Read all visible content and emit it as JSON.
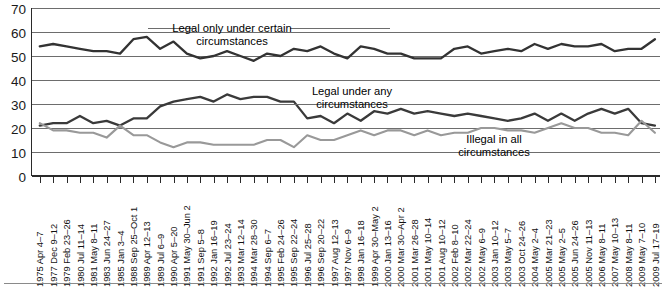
{
  "chart_data": {
    "type": "line",
    "title": "",
    "subtitle": "",
    "xlabel": "",
    "ylabel": "",
    "ylim": [
      0,
      70
    ],
    "yticks": [
      0,
      10,
      20,
      30,
      40,
      50,
      60,
      70
    ],
    "grid": true,
    "legend_position": "inline-annotations",
    "categories": [
      "1975 Apr 4–7",
      "1977 Dec 9–12",
      "1979 Feb 23–26",
      "1980 Jul 11–14",
      "1981 May 8–11",
      "1983 Jun 24–27",
      "1985 Jan 3–4",
      "1988 Sep 25–Oct 1",
      "1989 Apr 12–13",
      "1989 Jul 6–9",
      "1990 Apr 5–20",
      "1991 May 30–Jun 2",
      "1991 Sep 5–8",
      "1992 Jan 16–19",
      "1992 Jul 23–24",
      "1993 Mar 12–14",
      "1994 Mar 28–30",
      "1994 Sep 6–7",
      "1995 Feb 24–26",
      "1995 Sep 22–24",
      "1996 Jul 25–28",
      "1996 Sep 20–22",
      "1997 Aug 12–13",
      "1997 Nov 6–9",
      "1998 Jan 16–18",
      "1999 Apr 30–May 2",
      "2000 Jan 13–16",
      "2000 Mar 30–Apr 2",
      "2001 Mar 26–28",
      "2001 May 10–14",
      "2001 Aug 10–12",
      "2002 Feb 8–10",
      "2002 Mar 22–24",
      "2002 May 6–9",
      "2003 Jan 10–12",
      "2003 May 5–7",
      "2003 Oct 24–26",
      "2004 May 2–4",
      "2005 Mar 21–23",
      "2005 May 2–5",
      "2005 Jun 24–26",
      "2005 Nov 11–13",
      "2006 May 8–11",
      "2007 May 10–13",
      "2008 May 8–11",
      "2009 May 7–10",
      "2009 Jul 17–19"
    ],
    "series": [
      {
        "name": "Legal only under certain circumstances",
        "color": "#333333",
        "values": [
          54,
          55,
          54,
          53,
          52,
          52,
          51,
          57,
          58,
          53,
          56,
          51,
          49,
          50,
          52,
          50,
          48,
          51,
          50,
          53,
          52,
          54,
          51,
          49,
          54,
          53,
          51,
          51,
          49,
          49,
          49,
          53,
          54,
          51,
          52,
          53,
          52,
          55,
          53,
          55,
          54,
          54,
          55,
          52,
          53,
          53,
          57
        ]
      },
      {
        "name": "Legal under any circumstances",
        "color": "#3a3a3a",
        "values": [
          21,
          22,
          22,
          25,
          22,
          23,
          21,
          24,
          24,
          29,
          31,
          32,
          33,
          31,
          34,
          32,
          33,
          33,
          31,
          31,
          24,
          25,
          22,
          26,
          23,
          27,
          26,
          28,
          26,
          27,
          26,
          25,
          26,
          25,
          24,
          23,
          24,
          26,
          23,
          26,
          23,
          26,
          28,
          26,
          28,
          22,
          21
        ]
      },
      {
        "name": "Illegal in all circumstances",
        "color": "#999999",
        "values": [
          22,
          19,
          19,
          18,
          18,
          16,
          21,
          17,
          17,
          14,
          12,
          14,
          14,
          13,
          13,
          13,
          13,
          15,
          15,
          12,
          17,
          15,
          15,
          17,
          19,
          17,
          19,
          19,
          17,
          19,
          17,
          18,
          18,
          20,
          20,
          19,
          19,
          18,
          20,
          22,
          20,
          20,
          18,
          18,
          17,
          23,
          18
        ]
      }
    ],
    "annotations": [
      {
        "id": "annot-legal-certain",
        "line1": "Legal only under certain",
        "line2": "circumstances"
      },
      {
        "id": "annot-legal-any",
        "line1": "Legal under any",
        "line2": "circumstances"
      },
      {
        "id": "annot-illegal-all",
        "line1": "Illegal in all",
        "line2": "circumstances"
      }
    ]
  }
}
